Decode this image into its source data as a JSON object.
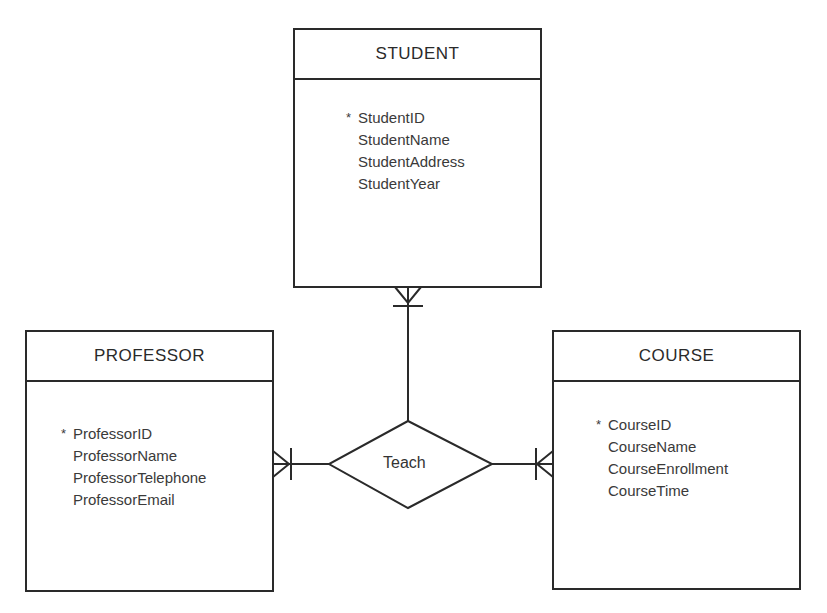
{
  "diagram": {
    "type": "entity-relationship",
    "entities": [
      {
        "name": "STUDENT",
        "attributes": [
          {
            "name": "StudentID",
            "primary_key": true
          },
          {
            "name": "StudentName",
            "primary_key": false
          },
          {
            "name": "StudentAddress",
            "primary_key": false
          },
          {
            "name": "StudentYear",
            "primary_key": false
          }
        ]
      },
      {
        "name": "PROFESSOR",
        "attributes": [
          {
            "name": "ProfessorID",
            "primary_key": true
          },
          {
            "name": "ProfessorName",
            "primary_key": false
          },
          {
            "name": "ProfessorTelephone",
            "primary_key": false
          },
          {
            "name": "ProfessorEmail",
            "primary_key": false
          }
        ]
      },
      {
        "name": "COURSE",
        "attributes": [
          {
            "name": "CourseID",
            "primary_key": true
          },
          {
            "name": "CourseName",
            "primary_key": false
          },
          {
            "name": "CourseEnrollment",
            "primary_key": false
          },
          {
            "name": "CourseTime",
            "primary_key": false
          }
        ]
      }
    ],
    "relationship": {
      "name": "Teach",
      "connections": [
        {
          "entity": "STUDENT",
          "cardinality": "one-or-many"
        },
        {
          "entity": "PROFESSOR",
          "cardinality": "one-or-many"
        },
        {
          "entity": "COURSE",
          "cardinality": "one-or-many"
        }
      ]
    },
    "pk_marker": "*",
    "colors": {
      "line": "#2a2a2a",
      "text": "#333333",
      "background": "#ffffff"
    }
  }
}
